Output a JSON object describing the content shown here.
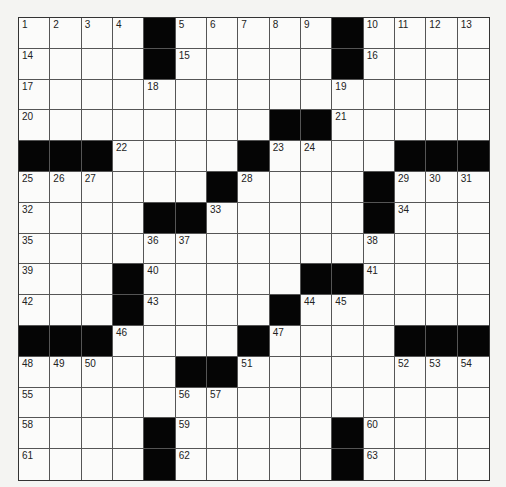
{
  "puzzle": {
    "rows": 15,
    "cols": 15,
    "layout": [
      "....#.....#....",
      "....#.....#....",
      "...............",
      "........##.....",
      "###....#....###",
      "......#....#...",
      "....##.....#...",
      "...............",
      "...#.....##....",
      "...#....#......",
      "###....#....###",
      ".....##........",
      "...............",
      "....#.....#....",
      "....#.....#...."
    ],
    "numbers": [
      [
        1,
        2,
        3,
        4,
        0,
        5,
        6,
        7,
        8,
        9,
        0,
        10,
        11,
        12,
        13
      ],
      [
        14,
        0,
        0,
        0,
        0,
        15,
        0,
        0,
        0,
        0,
        0,
        16,
        0,
        0,
        0
      ],
      [
        17,
        0,
        0,
        0,
        18,
        0,
        0,
        0,
        0,
        0,
        19,
        0,
        0,
        0,
        0
      ],
      [
        20,
        0,
        0,
        0,
        0,
        0,
        0,
        0,
        0,
        0,
        21,
        0,
        0,
        0,
        0
      ],
      [
        0,
        0,
        0,
        22,
        0,
        0,
        0,
        0,
        23,
        24,
        0,
        0,
        0,
        0,
        0
      ],
      [
        25,
        26,
        27,
        0,
        0,
        0,
        0,
        28,
        0,
        0,
        0,
        0,
        29,
        30,
        31
      ],
      [
        32,
        0,
        0,
        0,
        0,
        0,
        33,
        0,
        0,
        0,
        0,
        0,
        34,
        0,
        0
      ],
      [
        35,
        0,
        0,
        0,
        36,
        37,
        0,
        0,
        0,
        0,
        0,
        38,
        0,
        0,
        0
      ],
      [
        39,
        0,
        0,
        0,
        40,
        0,
        0,
        0,
        0,
        0,
        0,
        41,
        0,
        0,
        0
      ],
      [
        42,
        0,
        0,
        0,
        43,
        0,
        0,
        0,
        0,
        44,
        45,
        0,
        0,
        0,
        0
      ],
      [
        0,
        0,
        0,
        46,
        0,
        0,
        0,
        0,
        47,
        0,
        0,
        0,
        0,
        0,
        0
      ],
      [
        48,
        49,
        50,
        0,
        0,
        0,
        0,
        51,
        0,
        0,
        0,
        0,
        52,
        53,
        54
      ],
      [
        55,
        0,
        0,
        0,
        0,
        56,
        57,
        0,
        0,
        0,
        0,
        0,
        0,
        0,
        0
      ],
      [
        58,
        0,
        0,
        0,
        0,
        59,
        0,
        0,
        0,
        0,
        0,
        60,
        0,
        0,
        0
      ],
      [
        61,
        0,
        0,
        0,
        0,
        62,
        0,
        0,
        0,
        0,
        0,
        63,
        0,
        0,
        0
      ]
    ],
    "letters": []
  },
  "colors": {
    "black_square": "#050505",
    "white_square": "#fbfbfa",
    "grid_line": "#555555"
  }
}
